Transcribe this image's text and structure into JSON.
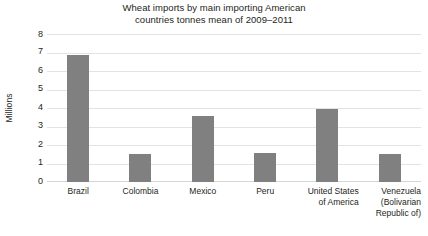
{
  "chart_data": {
    "type": "bar",
    "title": "Wheat imports by main importing American countries tonnes mean of 2009–2011",
    "title_lines": [
      "Wheat imports by main importing American",
      "countries tonnes mean of 2009–2011"
    ],
    "xlabel": "",
    "ylabel": "Millions",
    "categories": [
      "Brazil",
      "Colombia",
      "Mexico",
      "Peru",
      "United States of America",
      "Venezuela (Bolivarian Republic of)"
    ],
    "category_lines": [
      [
        "Brazil"
      ],
      [
        "Colombia"
      ],
      [
        "Mexico"
      ],
      [
        "Peru"
      ],
      [
        "United States",
        "of America"
      ],
      [
        "Venezuela",
        "(Bolivarian",
        "Republic of)"
      ]
    ],
    "values": [
      6.9,
      1.5,
      3.6,
      1.6,
      4.0,
      1.5
    ],
    "ylim": [
      0,
      8
    ],
    "yticks": [
      8,
      7,
      6,
      5,
      4,
      3,
      2,
      1,
      0
    ],
    "grid": true,
    "legend": false,
    "bar_color": "#808080",
    "grid_color": "#e3e3e3",
    "text_color": "#231f20",
    "background": "#ffffff"
  }
}
